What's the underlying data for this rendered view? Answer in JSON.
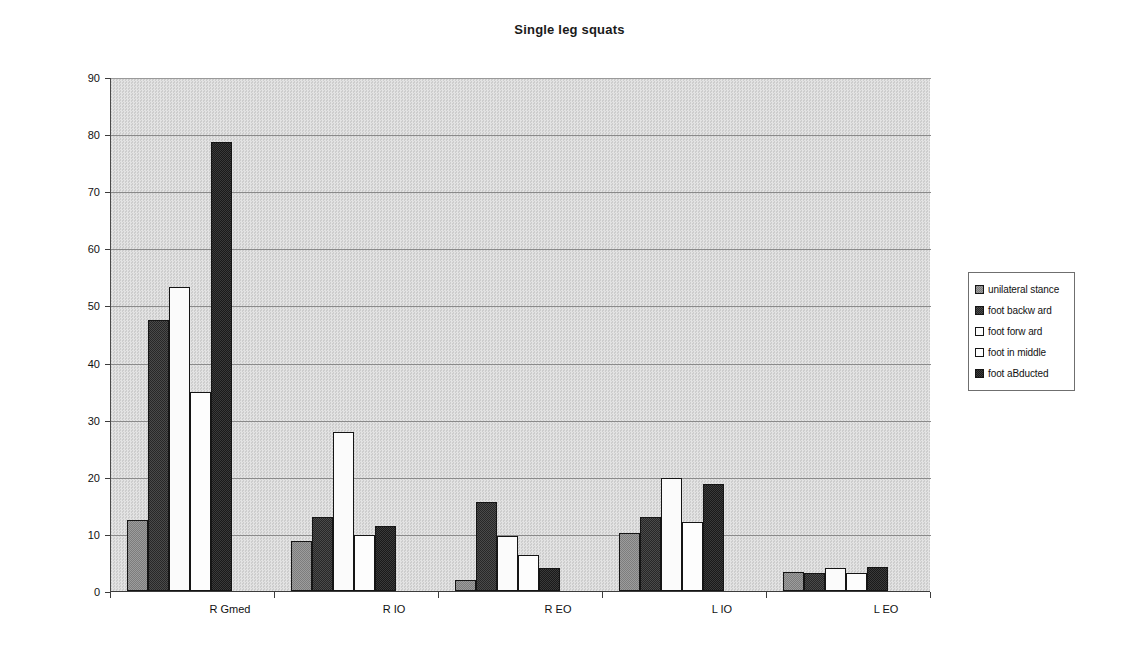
{
  "chart_data": {
    "type": "bar",
    "title": "Single leg squats",
    "xlabel": "",
    "ylabel": "%MVC",
    "ylim": [
      0,
      90
    ],
    "ytick_step": 10,
    "yticks": [
      0,
      10,
      20,
      30,
      40,
      50,
      60,
      70,
      80,
      90
    ],
    "grid": true,
    "legend_position": "right",
    "categories": [
      "R Gmed",
      "R IO",
      "R EO",
      "L IO",
      "L EO"
    ],
    "series": [
      {
        "name": "unilateral stance",
        "swatch": "medium-gray-dither",
        "color": "#8e8e8e",
        "values": [
          12.5,
          8.7,
          2.0,
          10.2,
          3.4
        ]
      },
      {
        "name": "foot backw ard",
        "swatch": "dark-gray-dither",
        "color": "#3a3a3a",
        "values": [
          47.5,
          12.9,
          15.5,
          12.9,
          3.2
        ]
      },
      {
        "name": "foot forw ard",
        "swatch": "white",
        "color": "#fbfbfb",
        "values": [
          53.3,
          27.8,
          9.7,
          19.7,
          4.1
        ]
      },
      {
        "name": "foot in middle",
        "swatch": "white",
        "color": "#fdfdfd",
        "values": [
          34.8,
          9.8,
          6.3,
          12.1,
          3.2
        ]
      },
      {
        "name": "foot aBducted",
        "swatch": "black-dither",
        "color": "#2b2b2b",
        "values": [
          78.6,
          11.4,
          4.1,
          18.7,
          4.2
        ]
      }
    ]
  },
  "plot": {
    "background_color": "#d8d8d8",
    "gridline_color": "#8a8a8a",
    "axis_color": "#3c3c3c"
  }
}
